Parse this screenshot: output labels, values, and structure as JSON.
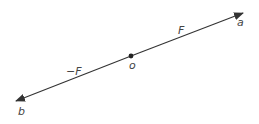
{
  "diagram": {
    "type": "vector-line",
    "colors": {
      "line": "#333333",
      "label": "#444444",
      "background": "#ffffff"
    },
    "points": {
      "a": {
        "label": "a",
        "x": 243,
        "y": 13
      },
      "b": {
        "label": "b",
        "x": 16,
        "y": 101
      },
      "o": {
        "label": "o",
        "x": 131,
        "y": 56
      }
    },
    "vectors": [
      {
        "from": "o",
        "to": "a",
        "label": "F"
      },
      {
        "from": "o",
        "to": "b",
        "label": "−F"
      }
    ],
    "labels": {
      "a": "a",
      "b": "b",
      "o": "o",
      "F": "F",
      "neg_F": "−F"
    }
  }
}
